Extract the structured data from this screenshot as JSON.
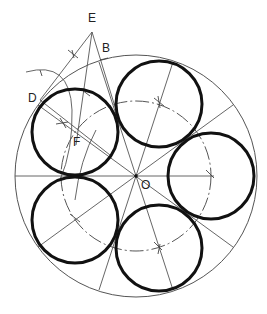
{
  "diagram": {
    "labels": {
      "E": "E",
      "B": "B",
      "D": "D",
      "F": "F",
      "O": "O"
    },
    "colors": {
      "thin_line": "#555555",
      "thick_circle": "#111111",
      "background": "#ffffff"
    },
    "outer_circle": {
      "cx": 136,
      "cy": 176,
      "r": 121
    },
    "pitch_circle": {
      "cx": 136,
      "cy": 176,
      "r": 75
    },
    "small_circles": [
      {
        "cx": 75,
        "cy": 132,
        "r": 43
      },
      {
        "cx": 159,
        "cy": 104,
        "r": 43
      },
      {
        "cx": 211,
        "cy": 176,
        "r": 43
      },
      {
        "cx": 159,
        "cy": 248,
        "r": 43
      },
      {
        "cx": 75,
        "cy": 220,
        "r": 43
      }
    ]
  }
}
